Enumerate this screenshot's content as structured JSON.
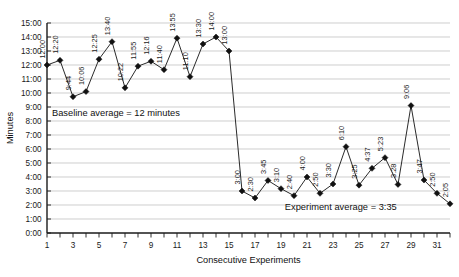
{
  "chart_data": {
    "type": "line",
    "title": "",
    "xlabel": "Consecutive Experiments",
    "ylabel": "Minutes",
    "ylim": [
      0,
      15
    ],
    "ytick_labels": [
      "0:00",
      "1:00",
      "2:00",
      "3:00",
      "4:00",
      "5:00",
      "6:00",
      "7:00",
      "8:00",
      "9:00",
      "10:00",
      "11:00",
      "12:00",
      "13:00",
      "14:00",
      "15:00"
    ],
    "ytick_values": [
      0,
      1,
      2,
      3,
      4,
      5,
      6,
      7,
      8,
      9,
      10,
      11,
      12,
      13,
      14,
      15
    ],
    "xtick_labels": [
      "1",
      "3",
      "5",
      "7",
      "9",
      "11",
      "13",
      "15",
      "17",
      "19",
      "21",
      "23",
      "25",
      "27",
      "29",
      "31"
    ],
    "xtick_values": [
      1,
      3,
      5,
      7,
      9,
      11,
      13,
      15,
      17,
      19,
      21,
      23,
      25,
      27,
      29,
      31
    ],
    "xlim": [
      1,
      32
    ],
    "grid": true,
    "legend": "none",
    "x": [
      1,
      2,
      3,
      4,
      5,
      6,
      7,
      8,
      9,
      10,
      11,
      12,
      13,
      14,
      15,
      16,
      17,
      18,
      19,
      20,
      21,
      22,
      23,
      24,
      25,
      26,
      27,
      28,
      29,
      30,
      31,
      32
    ],
    "values": [
      12.0,
      12.333,
      9.733,
      10.1,
      12.417,
      13.667,
      10.367,
      11.917,
      12.267,
      11.667,
      13.917,
      11.167,
      13.5,
      14.0,
      13.0,
      3.0,
      2.5,
      3.75,
      3.167,
      2.667,
      4.0,
      2.833,
      3.5,
      6.167,
      3.417,
      4.617,
      5.383,
      3.467,
      9.1,
      3.783,
      2.833,
      2.083
    ],
    "point_labels": [
      "12:00",
      "12:20",
      "9:44",
      "10:06",
      "12:25",
      "13:40",
      "10:22",
      "11:55",
      "12:16",
      "11:40",
      "13:55",
      "11:10",
      "13:30",
      "14:00",
      "13:00",
      "3:00",
      "2:30",
      "3:45",
      "3:10",
      "2:40",
      "4:00",
      "2:50",
      "3:30",
      "6:10",
      "3:25",
      "4:37",
      "5:23",
      "3:28",
      "9:06",
      "3:47",
      "2:50",
      "2:05"
    ],
    "annotations": [
      {
        "name": "baseline-average-annotation",
        "text": "Baseline average = 12 minutes",
        "x_value": 6.3,
        "y_value": 8.35
      },
      {
        "name": "experiment-average-annotation",
        "text": "Experiment average = 3:35",
        "x_value": 23.6,
        "y_value": 1.62
      }
    ],
    "series_color": "#2b2b2b",
    "marker_color": "#111111",
    "grid_color": "#b9b9b9",
    "axis_color": "#1a1a1a"
  }
}
